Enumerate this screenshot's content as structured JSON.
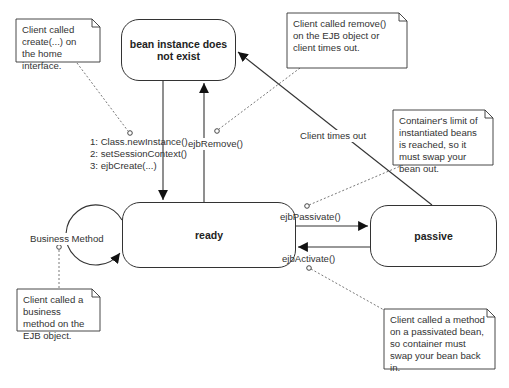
{
  "diagram": {
    "type": "UML state diagram",
    "states": [
      {
        "id": "does-not-exist",
        "label": "bean instance does not exist"
      },
      {
        "id": "ready",
        "label": "ready"
      },
      {
        "id": "passive",
        "label": "passive"
      }
    ],
    "transitions": {
      "create": {
        "lines": [
          "1: Class.newInstance()",
          "2: setSessionContext()",
          "3: ejbCreate(...)"
        ]
      },
      "remove": {
        "label": "ejbRemove()"
      },
      "timeout": {
        "label": "Client times out"
      },
      "passivate": {
        "label": "ejbPassivate()"
      },
      "activate": {
        "label": "ejbActivate()"
      },
      "business": {
        "label": "Business Method"
      }
    },
    "notes": {
      "create_note": "Client called create(...) on the home interface.",
      "remove_note": "Client called remove() on the EJB object or client times out.",
      "passivate_note": "Container's limit of instantiated beans is reached, so it must swap your bean out.",
      "business_note": "Client called a business method on the EJB object.",
      "activate_note": "Client called a method on a passivated bean, so container must swap your bean back in."
    },
    "colors": {
      "line": "#333333",
      "background": "#ffffff",
      "text": "#222222"
    }
  }
}
